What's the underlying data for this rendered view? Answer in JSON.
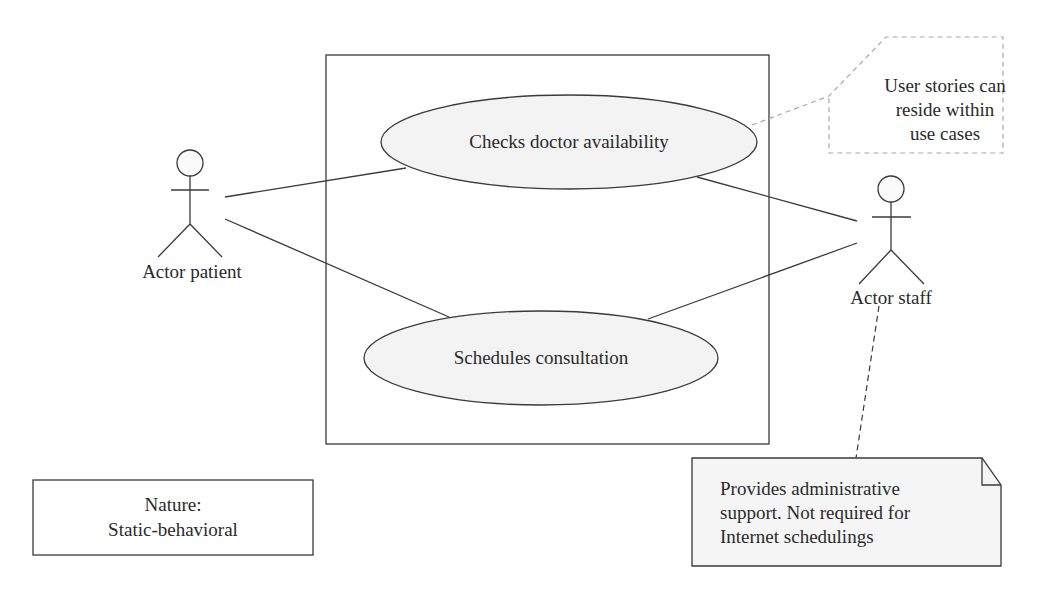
{
  "diagram": {
    "type": "UML use case diagram",
    "colors": {
      "stroke": "#3a3a3a",
      "ellipse_fill": "#f3f3f3",
      "note_fill": "#f5f5f5",
      "dashed_stroke": "#a8a8a8",
      "background": "#ffffff"
    },
    "actors": [
      {
        "id": "patient",
        "label": "Actor patient"
      },
      {
        "id": "staff",
        "label": "Actor staff"
      }
    ],
    "use_cases": [
      {
        "id": "checks",
        "label": "Checks doctor availability"
      },
      {
        "id": "schedules",
        "label": "Schedules consultation"
      }
    ],
    "associations": [
      {
        "from": "patient",
        "to": "checks"
      },
      {
        "from": "patient",
        "to": "schedules"
      },
      {
        "from": "staff",
        "to": "checks"
      },
      {
        "from": "staff",
        "to": "schedules"
      }
    ],
    "callout": {
      "lines": [
        "User stories can",
        "reside within",
        "use cases"
      ],
      "attached_to": "checks"
    },
    "note": {
      "lines": [
        "Provides administrative",
        "support. Not required for",
        "Internet schedulings"
      ],
      "attached_to": "staff"
    },
    "nature_box": {
      "lines": [
        "Nature:",
        "Static-behavioral"
      ]
    }
  }
}
